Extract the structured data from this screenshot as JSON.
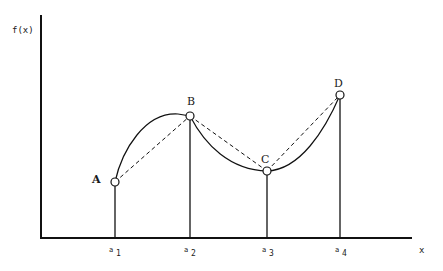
{
  "diagram": {
    "y_axis_label": "f(x)",
    "x_axis_label": "x",
    "colors": {
      "line": "#111111",
      "background": "#ffffff",
      "point_fill": "#ffffff"
    },
    "points": [
      {
        "name": "A",
        "x_label": "a",
        "x_sub": "1"
      },
      {
        "name": "B",
        "x_label": "a",
        "x_sub": "2"
      },
      {
        "name": "C",
        "x_label": "a",
        "x_sub": "3"
      },
      {
        "name": "D",
        "x_label": "a",
        "x_sub": "4"
      }
    ],
    "curve": "solid smooth curve through A, B, C, D (concave between A-B, convex between B-D)",
    "chords": "dashed straight segments A-B, B-C, C-D"
  }
}
